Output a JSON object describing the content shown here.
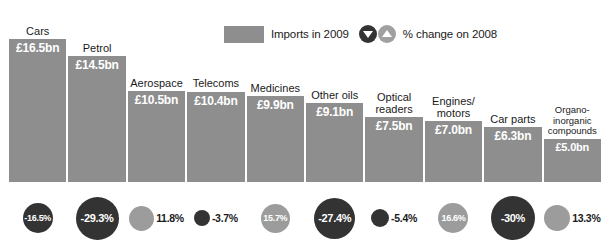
{
  "legend": {
    "swatch_label": "Imports in 2009",
    "change_label": "% change on 2008",
    "swatch_color": "#8e8e8e",
    "down_icon": "triangle-down-icon",
    "up_icon": "triangle-up-icon",
    "negative_color": "#333333",
    "positive_color": "#9c9c9c"
  },
  "chart_data": {
    "type": "bar",
    "title": "",
    "subtitle": "",
    "xlabel": "",
    "ylabel": "",
    "ylim": [
      0,
      16.5
    ],
    "grid": false,
    "legend_position": "top-center",
    "categories": [
      "Cars",
      "Petrol",
      "Aerospace",
      "Telecoms",
      "Medicines",
      "Other oils",
      "Optical\nreaders",
      "Engines/\nmotors",
      "Car parts",
      "Organo-\ninorganic\ncompounds"
    ],
    "value_labels": [
      "£16.5bn",
      "£14.5bn",
      "£10.5bn",
      "£10.4bn",
      "£9.9bn",
      "£9.1bn",
      "£7.5bn",
      "£7.0bn",
      "£6.3bn",
      "£5.0bn"
    ],
    "values": [
      16.5,
      14.5,
      10.5,
      10.4,
      9.9,
      9.1,
      7.5,
      7.0,
      6.3,
      5.0
    ],
    "series": [
      {
        "name": "Imports in 2009 (£bn)",
        "values": [
          16.5,
          14.5,
          10.5,
          10.4,
          9.9,
          9.1,
          7.5,
          7.0,
          6.3,
          5.0
        ]
      },
      {
        "name": "% change on 2008",
        "values": [
          -16.5,
          -29.3,
          11.8,
          -3.7,
          15.7,
          -27.4,
          -5.4,
          16.6,
          -30,
          13.3
        ]
      }
    ],
    "change_labels": [
      "-16.5%",
      "-29.3%",
      "11.8%",
      "-3.7%",
      "15.7%",
      "-27.4%",
      "-5.4%",
      "16.6%",
      "-30%",
      "13.3%"
    ]
  }
}
